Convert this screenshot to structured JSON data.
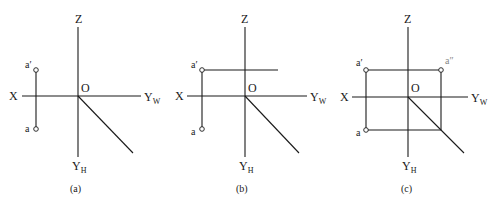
{
  "figures": [
    {
      "id": "a",
      "caption": "(a)",
      "axis_labels": {
        "x": "X",
        "z": "Z",
        "origin": "O",
        "yw_main": "Y",
        "yw_sub": "W",
        "yh_main": "Y",
        "yh_sub": "H"
      },
      "points": {
        "a_prime": "a′",
        "a": "a"
      }
    },
    {
      "id": "b",
      "caption": "(b)",
      "axis_labels": {
        "x": "X",
        "z": "Z",
        "origin": "O",
        "yw_main": "Y",
        "yw_sub": "W",
        "yh_main": "Y",
        "yh_sub": "H"
      },
      "points": {
        "a_prime": "a′",
        "a": "a"
      }
    },
    {
      "id": "c",
      "caption": "(c)",
      "axis_labels": {
        "x": "X",
        "z": "Z",
        "origin": "O",
        "yw_main": "Y",
        "yw_sub": "W",
        "yh_main": "Y",
        "yh_sub": "H"
      },
      "points": {
        "a_prime": "a′",
        "a": "a",
        "a_double_prime": "a″"
      }
    }
  ]
}
